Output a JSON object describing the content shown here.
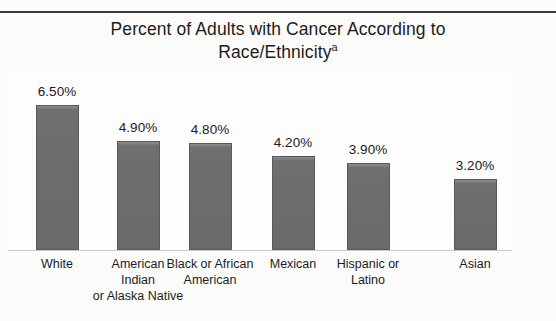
{
  "document": {
    "has_top_rule": true,
    "background_color": "#fbfbfa"
  },
  "chart_data": {
    "type": "bar",
    "title": "Percent of Adults with Cancer According to\nRace/Ethnicity",
    "title_superscript": "a",
    "xlabel": "",
    "ylabel": "",
    "ylim": [
      0,
      6.5
    ],
    "grid": false,
    "legend": null,
    "axis_tick_labels": [],
    "bar_color": "#6f6f6f",
    "bar_edge_color": "#595959",
    "categories": [
      "White",
      "American\nIndian\nor Alaska Native",
      "Black or African\nAmerican",
      "Mexican",
      "Hispanic or\nLatino",
      "Asian"
    ],
    "values": [
      6.5,
      4.9,
      4.8,
      4.2,
      3.9,
      3.2
    ],
    "value_labels": [
      "6.50%",
      "4.90%",
      "4.80%",
      "4.20%",
      "3.90%",
      "3.20%"
    ]
  }
}
